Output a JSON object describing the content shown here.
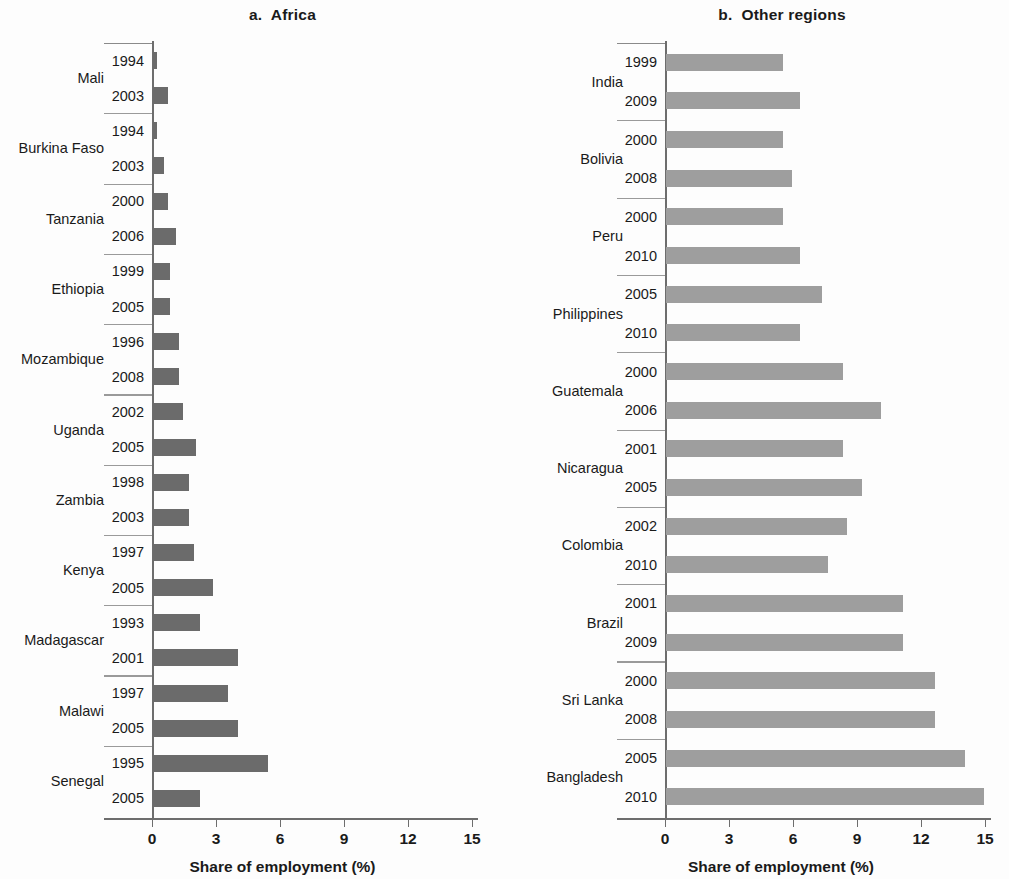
{
  "figure": {
    "background": "#ffffff",
    "panel_a_bar_color": "#6b6b6b",
    "panel_b_bar_color": "#9e9e9e"
  },
  "panels": [
    {
      "id": "a",
      "title": "a.  Africa",
      "xlabel": "Share of employment (%)",
      "xticks": [
        "0",
        "3",
        "6",
        "9",
        "12",
        "15"
      ]
    },
    {
      "id": "b",
      "title": "b.  Other regions",
      "xlabel": "Share of employment (%)",
      "xticks": [
        "0",
        "3",
        "6",
        "9",
        "12",
        "15"
      ]
    }
  ],
  "chart_data": [
    {
      "type": "bar",
      "orientation": "horizontal",
      "title": "a.  Africa",
      "xlabel": "Share of employment (%)",
      "ylabel": "",
      "xlim": [
        0,
        15
      ],
      "xticks": [
        0,
        3,
        6,
        9,
        12,
        15
      ],
      "grid": false,
      "legend": "none",
      "bar_color": "#6b6b6b",
      "groups": [
        {
          "country": "Mali",
          "points": [
            {
              "year": "1994",
              "value": 0.2
            },
            {
              "year": "2003",
              "value": 0.7
            }
          ]
        },
        {
          "country": "Burkina Faso",
          "points": [
            {
              "year": "1994",
              "value": 0.2
            },
            {
              "year": "2003",
              "value": 0.5
            }
          ]
        },
        {
          "country": "Tanzania",
          "points": [
            {
              "year": "2000",
              "value": 0.7
            },
            {
              "year": "2006",
              "value": 1.1
            }
          ]
        },
        {
          "country": "Ethiopia",
          "points": [
            {
              "year": "1999",
              "value": 0.8
            },
            {
              "year": "2005",
              "value": 0.8
            }
          ]
        },
        {
          "country": "Mozambique",
          "points": [
            {
              "year": "1996",
              "value": 1.2
            },
            {
              "year": "2008",
              "value": 1.2
            }
          ]
        },
        {
          "country": "Uganda",
          "points": [
            {
              "year": "2002",
              "value": 1.4
            },
            {
              "year": "2005",
              "value": 2.0
            }
          ]
        },
        {
          "country": "Zambia",
          "points": [
            {
              "year": "1998",
              "value": 1.7
            },
            {
              "year": "2003",
              "value": 1.7
            }
          ]
        },
        {
          "country": "Kenya",
          "points": [
            {
              "year": "1997",
              "value": 1.9
            },
            {
              "year": "2005",
              "value": 2.8
            }
          ]
        },
        {
          "country": "Madagascar",
          "points": [
            {
              "year": "1993",
              "value": 2.2
            },
            {
              "year": "2001",
              "value": 4.0
            }
          ]
        },
        {
          "country": "Malawi",
          "points": [
            {
              "year": "1997",
              "value": 3.5
            },
            {
              "year": "2005",
              "value": 4.0
            }
          ]
        },
        {
          "country": "Senegal",
          "points": [
            {
              "year": "1995",
              "value": 5.4
            },
            {
              "year": "2005",
              "value": 2.2
            }
          ]
        }
      ]
    },
    {
      "type": "bar",
      "orientation": "horizontal",
      "title": "b.  Other regions",
      "xlabel": "Share of employment (%)",
      "ylabel": "",
      "xlim": [
        0,
        15
      ],
      "xticks": [
        0,
        3,
        6,
        9,
        12,
        15
      ],
      "grid": false,
      "legend": "none",
      "bar_color": "#9e9e9e",
      "groups": [
        {
          "country": "India",
          "points": [
            {
              "year": "1999",
              "value": 5.5
            },
            {
              "year": "2009",
              "value": 6.3
            }
          ]
        },
        {
          "country": "Bolivia",
          "points": [
            {
              "year": "2000",
              "value": 5.5
            },
            {
              "year": "2008",
              "value": 5.9
            }
          ]
        },
        {
          "country": "Peru",
          "points": [
            {
              "year": "2000",
              "value": 5.5
            },
            {
              "year": "2010",
              "value": 6.3
            }
          ]
        },
        {
          "country": "Philippines",
          "points": [
            {
              "year": "2005",
              "value": 7.3
            },
            {
              "year": "2010",
              "value": 6.3
            }
          ]
        },
        {
          "country": "Guatemala",
          "points": [
            {
              "year": "2000",
              "value": 8.3
            },
            {
              "year": "2006",
              "value": 10.1
            }
          ]
        },
        {
          "country": "Nicaragua",
          "points": [
            {
              "year": "2001",
              "value": 8.3
            },
            {
              "year": "2005",
              "value": 9.2
            }
          ]
        },
        {
          "country": "Colombia",
          "points": [
            {
              "year": "2002",
              "value": 8.5
            },
            {
              "year": "2010",
              "value": 7.6
            }
          ]
        },
        {
          "country": "Brazil",
          "points": [
            {
              "year": "2001",
              "value": 11.1
            },
            {
              "year": "2009",
              "value": 11.1
            }
          ]
        },
        {
          "country": "Sri Lanka",
          "points": [
            {
              "year": "2000",
              "value": 12.6
            },
            {
              "year": "2008",
              "value": 12.6
            }
          ]
        },
        {
          "country": "Bangladesh",
          "points": [
            {
              "year": "2005",
              "value": 14.0
            },
            {
              "year": "2010",
              "value": 14.9
            }
          ]
        }
      ]
    }
  ]
}
